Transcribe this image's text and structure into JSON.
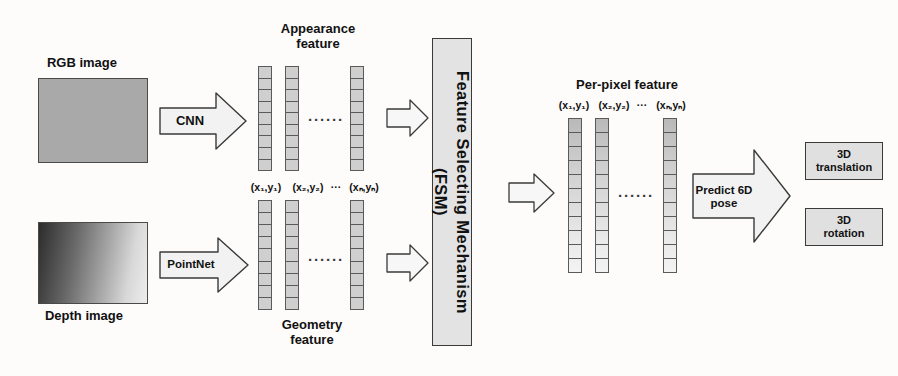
{
  "diagram": {
    "inputs": [
      {
        "name": "rgb-image",
        "label": "RGB image",
        "kind": "flat-gray"
      },
      {
        "name": "depth-image",
        "label": "Depth image",
        "kind": "gradient"
      }
    ],
    "encoders": [
      {
        "name": "cnn",
        "label": "CNN"
      },
      {
        "name": "pointnet",
        "label": "PointNet"
      }
    ],
    "feature_groups": [
      {
        "name": "appearance-feature",
        "label": "Appearance\nfeature",
        "label_position": "above",
        "coord_labels": [
          "(x₁,y₁)",
          "(x₂,y₂)",
          "(xₙ,yₙ)"
        ],
        "coord_ellipsis": "···",
        "ellipsis": "······",
        "columns": 3,
        "cells_per_column": 9
      },
      {
        "name": "geometry-feature",
        "label": "Geometry\nfeature",
        "label_position": "below",
        "coord_labels": [
          "(x₁,y₁)",
          "(x₂,y₂)",
          "(xₙ,yₙ)"
        ],
        "coord_ellipsis": "···",
        "ellipsis": "······",
        "columns": 3,
        "cells_per_column": 9
      }
    ],
    "fsm": {
      "name": "feature-selecting-mechanism",
      "label": "Feature Selecting Mechanism\n(FSM)"
    },
    "per_pixel": {
      "name": "per-pixel-feature",
      "label": "Per-pixel feature",
      "coord_labels": [
        "(x₁,y₁)",
        "(x₂,y₂)",
        "(xₙ,yₙ)"
      ],
      "coord_ellipsis": "···",
      "ellipsis": "······",
      "columns": 3,
      "cells_per_column": 11
    },
    "predictor": {
      "name": "predict-6d-pose",
      "label": "Predict 6D\npose"
    },
    "outputs": [
      {
        "name": "output-3d-translation",
        "label": "3D\ntranslation"
      },
      {
        "name": "output-3d-rotation",
        "label": "3D\nrotation"
      }
    ],
    "plain_arrows": [
      {
        "name": "arrow-appearance-to-fsm"
      },
      {
        "name": "arrow-geometry-to-fsm"
      },
      {
        "name": "arrow-fsm-to-perpixel"
      }
    ],
    "colors": {
      "stroke": "#3a3a3a",
      "fill_light": "#f2f2f2",
      "fill_box": "#e3e3e3",
      "cell": "#cfcfcf",
      "rgb_image": "#a9a9a9",
      "background": "#fdfcfa"
    }
  }
}
